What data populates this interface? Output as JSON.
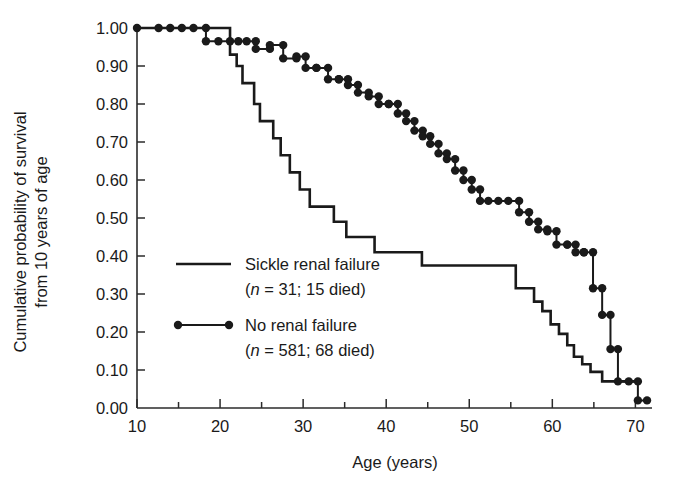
{
  "chart_data": {
    "type": "line",
    "title": "",
    "xlabel": "Age (years)",
    "ylabel": "Cumulative probability of survival from 10 years of age",
    "ylabel_line1": "Cumulative probability of survival",
    "ylabel_line2": "from 10 years of age",
    "xlim": [
      10,
      72
    ],
    "ylim": [
      0.0,
      1.0
    ],
    "grid": false,
    "legend_position": "inside-lower-left",
    "x_ticks_major": [
      10,
      20,
      30,
      40,
      50,
      60,
      70
    ],
    "x_ticks_minor": [
      15,
      25,
      35,
      45,
      55,
      65
    ],
    "y_ticks": [
      "1.00",
      "0.90",
      "0.80",
      "0.70",
      "0.60",
      "0.50",
      "0.40",
      "0.30",
      "0.20",
      "0.10",
      "0.00"
    ],
    "y_tick_values": [
      1.0,
      0.9,
      0.8,
      0.7,
      0.6,
      0.5,
      0.4,
      0.3,
      0.2,
      0.1,
      0.0
    ],
    "series": [
      {
        "name": "Sickle renal failure",
        "style": "solid-step",
        "markers": false,
        "n": 31,
        "died": 15,
        "legend_label": "Sickle renal failure",
        "legend_detail_prefix": "(",
        "legend_detail_italic": "n",
        "legend_detail_rest": " = 31; 15 died)",
        "x": [
          10,
          20.3,
          21.2,
          22.0,
          22.7,
          23.4,
          24.1,
          24.8,
          25.6,
          26.4,
          27.3,
          28.4,
          29.6,
          30.8,
          32.2,
          33.7,
          35.2,
          36.9,
          38.6,
          44.3,
          55.6,
          56.8,
          57.8,
          58.8,
          59.8,
          60.8,
          61.8,
          62.6,
          63.6,
          64.6,
          66.0,
          70.2
        ],
        "y": [
          1.0,
          1.0,
          0.93,
          0.9,
          0.855,
          0.855,
          0.8,
          0.755,
          0.755,
          0.71,
          0.665,
          0.62,
          0.575,
          0.53,
          0.53,
          0.49,
          0.45,
          0.45,
          0.41,
          0.375,
          0.315,
          0.315,
          0.28,
          0.255,
          0.22,
          0.195,
          0.165,
          0.135,
          0.115,
          0.095,
          0.07,
          0.07
        ]
      },
      {
        "name": "No renal failure",
        "style": "dotted-step",
        "markers": true,
        "n": 581,
        "died": 68,
        "legend_label": "No renal failure",
        "legend_detail_prefix": "(",
        "legend_detail_italic": "n",
        "legend_detail_rest": " = 581; 68 died)",
        "x": [
          10.0,
          12.6,
          14.0,
          15.4,
          16.8,
          18.3,
          18.3,
          19.8,
          21.2,
          22.2,
          23.2,
          24.3,
          24.3,
          26.0,
          26.0,
          27.6,
          27.6,
          29.2,
          29.2,
          30.3,
          30.3,
          31.6,
          31.6,
          33.0,
          33.0,
          34.3,
          34.3,
          35.4,
          35.4,
          36.6,
          36.6,
          37.9,
          37.9,
          39.1,
          39.1,
          40.3,
          40.3,
          41.4,
          41.4,
          42.4,
          42.4,
          43.4,
          43.4,
          44.4,
          44.4,
          45.3,
          45.3,
          46.3,
          46.3,
          47.3,
          47.3,
          48.3,
          48.3,
          49.3,
          49.3,
          50.3,
          50.3,
          51.3,
          51.3,
          52.3,
          53.5,
          54.7,
          56.0,
          56.0,
          57.2,
          57.2,
          58.3,
          58.3,
          59.4,
          59.4,
          60.5,
          60.5,
          61.8,
          61.8,
          62.8,
          62.8,
          63.8,
          63.8,
          64.9,
          64.9,
          66.0,
          66.0,
          67.0,
          67.0,
          67.9,
          67.9,
          69.2,
          70.3,
          70.3,
          71.4
        ],
        "y": [
          1.0,
          1.0,
          1.0,
          1.0,
          1.0,
          1.0,
          0.965,
          0.965,
          0.965,
          0.965,
          0.965,
          0.965,
          0.945,
          0.945,
          0.955,
          0.955,
          0.92,
          0.92,
          0.925,
          0.925,
          0.895,
          0.895,
          0.895,
          0.895,
          0.865,
          0.865,
          0.865,
          0.865,
          0.85,
          0.85,
          0.83,
          0.83,
          0.82,
          0.82,
          0.8,
          0.8,
          0.8,
          0.8,
          0.775,
          0.775,
          0.755,
          0.755,
          0.73,
          0.73,
          0.715,
          0.715,
          0.695,
          0.695,
          0.67,
          0.67,
          0.655,
          0.655,
          0.625,
          0.625,
          0.6,
          0.6,
          0.575,
          0.575,
          0.545,
          0.545,
          0.545,
          0.545,
          0.545,
          0.515,
          0.515,
          0.49,
          0.49,
          0.47,
          0.47,
          0.465,
          0.465,
          0.43,
          0.43,
          0.43,
          0.43,
          0.41,
          0.41,
          0.41,
          0.41,
          0.315,
          0.315,
          0.245,
          0.245,
          0.155,
          0.155,
          0.07,
          0.07,
          0.07,
          0.02,
          0.02
        ]
      }
    ]
  },
  "legend": {
    "entries": [
      {
        "label": "Sickle renal failure",
        "detail_open": "(",
        "detail_n": "n",
        "detail_rest": " = 31; 15 died)",
        "swatch": "solid-line"
      },
      {
        "label": "No renal failure",
        "detail_open": "(",
        "detail_n": "n",
        "detail_rest": " = 581; 68 died)",
        "swatch": "dotted-line-with-markers"
      }
    ]
  },
  "colors": {
    "ink": "#1a1a1a",
    "axis": "#2b2b2b",
    "background": "#ffffff"
  }
}
